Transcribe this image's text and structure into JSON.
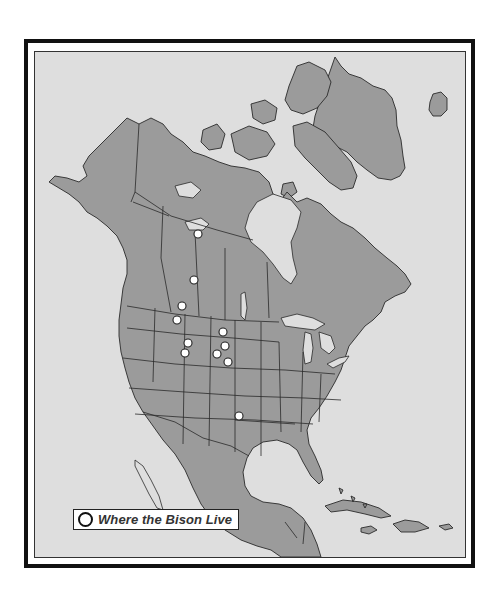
{
  "map": {
    "title": "Bison range map of North America",
    "colors": {
      "frame": "#111111",
      "ocean": "#dedede",
      "land": "#9b9b9b",
      "outline": "#2a2a2a",
      "marker": "#ffffff"
    },
    "legend": {
      "marker_icon": "open-circle",
      "label": "Where the Bison Live"
    },
    "bison_locations": [
      {
        "region": "Northwest Territories / Wood Buffalo (north)"
      },
      {
        "region": "Alberta (Elk Island)"
      },
      {
        "region": "Alberta / Saskatchewan border (south)"
      },
      {
        "region": "Montana (National Bison Range)"
      },
      {
        "region": "Wyoming (Yellowstone)"
      },
      {
        "region": "Wyoming (Grand Teton)"
      },
      {
        "region": "North Dakota (Theodore Roosevelt)"
      },
      {
        "region": "South Dakota (Badlands)"
      },
      {
        "region": "South Dakota (Wind Cave)"
      },
      {
        "region": "South Dakota (Custer)"
      },
      {
        "region": "Oklahoma (Wichita Mountains)"
      }
    ]
  }
}
